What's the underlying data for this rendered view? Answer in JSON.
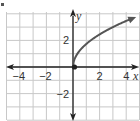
{
  "chart_data": {
    "type": "line",
    "title": "",
    "xlabel": "x",
    "ylabel": "y",
    "xlim": [
      -5,
      5
    ],
    "ylim": [
      -4,
      4
    ],
    "grid": true,
    "x_ticks": [
      {
        "value": -4,
        "label": "−4"
      },
      {
        "value": -2,
        "label": "−2"
      },
      {
        "value": 2,
        "label": "2"
      },
      {
        "value": 4,
        "label": "4"
      }
    ],
    "y_ticks": [
      {
        "value": 2,
        "label": "2"
      },
      {
        "value": -2,
        "label": "−2"
      }
    ],
    "series": [
      {
        "name": "curve",
        "function": "square-root shape starting at origin",
        "x": [
          0,
          0.25,
          0.5,
          1,
          1.5,
          2,
          2.5,
          3,
          3.5,
          4,
          4.6
        ],
        "y": [
          0,
          0.87,
          1.22,
          1.73,
          2.12,
          2.45,
          2.74,
          3.0,
          3.24,
          3.46,
          3.71
        ],
        "start_point": {
          "x": 0,
          "y": 0,
          "style": "closed-dot"
        },
        "end": "arrow"
      }
    ],
    "legend": null
  },
  "labels": {
    "bullet": "•",
    "x_axis": "x",
    "y_axis": "y"
  },
  "colors": {
    "curve": "#555555",
    "axis": "#222222",
    "grid": "#c8c8c8"
  }
}
